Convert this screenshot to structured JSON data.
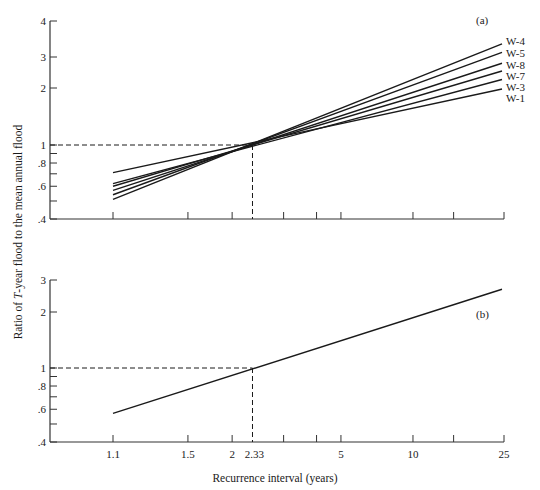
{
  "chart_data": [
    {
      "panel": "(a)",
      "type": "line",
      "xscale": "gumbel-probability",
      "yscale": "log",
      "ylabel": "Ratio of T-year flood to the mean annual flood",
      "xlabel": "Recurrence interval (years)",
      "ylim": [
        0.4,
        4
      ],
      "y_ticks_labeled": [
        "4",
        "3",
        "2",
        "1",
        ".8",
        ".6",
        ".4"
      ],
      "y_ticks_minor": [
        0.9,
        0.7,
        0.5
      ],
      "x_ticks": [
        1.1,
        1.5,
        2,
        2.33,
        3,
        4,
        5,
        10,
        15,
        25
      ],
      "reference_point": {
        "x": 2.33,
        "y": 1.0,
        "style": "dashed"
      },
      "series": [
        {
          "name": "W-4",
          "x": [
            1.1,
            25
          ],
          "values": [
            0.51,
            3.5
          ]
        },
        {
          "name": "W-5",
          "x": [
            1.1,
            25
          ],
          "values": [
            0.54,
            3.15
          ]
        },
        {
          "name": "W-8",
          "x": [
            1.1,
            25
          ],
          "values": [
            0.57,
            2.75
          ]
        },
        {
          "name": "W-7",
          "x": [
            1.1,
            25
          ],
          "values": [
            0.6,
            2.5
          ]
        },
        {
          "name": "W-3",
          "x": [
            1.1,
            25
          ],
          "values": [
            0.62,
            2.25
          ]
        },
        {
          "name": "W-1",
          "x": [
            1.1,
            25
          ],
          "values": [
            0.71,
            2.0
          ]
        }
      ]
    },
    {
      "panel": "(b)",
      "type": "line",
      "xscale": "gumbel-probability",
      "yscale": "log",
      "ylim": [
        0.4,
        3
      ],
      "y_ticks_labeled": [
        "3",
        "2",
        "1",
        ".8",
        ".6",
        ".4"
      ],
      "y_ticks_minor": [
        0.9,
        0.7,
        0.5
      ],
      "x_ticks": [
        1.1,
        1.5,
        2,
        2.33,
        3,
        4,
        5,
        10,
        15,
        25
      ],
      "x_tick_labels": [
        "1.1",
        "1.5",
        "2",
        "2.33",
        "",
        "",
        "5",
        "10",
        "",
        "25"
      ],
      "reference_point": {
        "x": 2.33,
        "y": 1.0,
        "style": "dashed"
      },
      "series": [
        {
          "name": "Regional curve",
          "x": [
            1.1,
            25
          ],
          "values": [
            0.57,
            2.65
          ]
        }
      ]
    }
  ],
  "labels": {
    "panel_a": "(a)",
    "panel_b": "(b)",
    "ylabel_prefix": "Ratio of ",
    "ylabel_italic": "T",
    "ylabel_suffix": "-year flood to the mean annual flood",
    "xlabel": "Recurrence interval (years)"
  },
  "colors": {
    "line": "#1a1a1a",
    "axis": "#333333",
    "background": "#ffffff"
  }
}
